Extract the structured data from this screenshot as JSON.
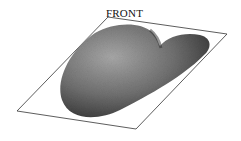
{
  "figure": {
    "label": "FRONT",
    "plane": {
      "points": [
        [
          108,
          17
        ],
        [
          227,
          34
        ],
        [
          136,
          129
        ],
        [
          17,
          111
        ]
      ],
      "stroke": "#333333"
    },
    "surface": {
      "shape": "heart-shaped 3D surface",
      "fill_light": "#9a9a9a",
      "fill_dark": "#3a3a3a"
    }
  }
}
